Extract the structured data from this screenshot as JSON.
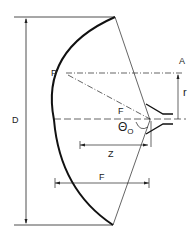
{
  "diagram": {
    "labels": {
      "D": "D",
      "P": "P",
      "A": "A",
      "r": "r",
      "F_focus": "F",
      "theta": "Θ",
      "theta_sub": "O",
      "Z": "Z",
      "F_length": "F"
    },
    "colors": {
      "stroke": "#111111",
      "background": "#ffffff"
    }
  }
}
